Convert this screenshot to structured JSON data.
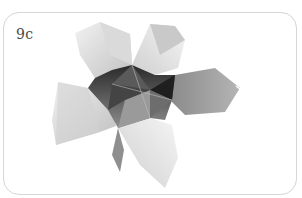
{
  "figure": {
    "step_label": "9c",
    "colors": {
      "frame_border": "#d6d6d6",
      "label": "#4a4a4a",
      "petal_light": "#e4e4e4",
      "petal_mid": "#bdbdbd",
      "center_dark": "#3a3a3a"
    }
  }
}
